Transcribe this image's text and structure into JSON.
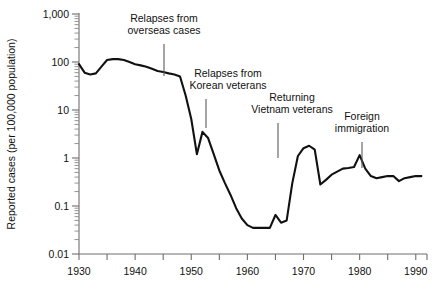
{
  "chart_data": {
    "type": "line",
    "title": "",
    "xlabel": "",
    "ylabel": "Reported cases (per 100,000 population)",
    "yscale": "log",
    "ylim": [
      0.01,
      1000
    ],
    "xlim": [
      1930,
      1992
    ],
    "grid": false,
    "legend": "none",
    "y_tick_labels": [
      "1,000",
      "100",
      "10",
      "1",
      "0.1",
      "0.01"
    ],
    "y_tick_values": [
      1000,
      100,
      10,
      1,
      0.1,
      0.01
    ],
    "x_tick_labels": [
      "1930",
      "1940",
      "1950",
      "1960",
      "1970",
      "1980",
      "1990"
    ],
    "x_tick_values": [
      1930,
      1940,
      1950,
      1960,
      1970,
      1980,
      1990
    ],
    "x_minor_tick_values": [
      1935,
      1945,
      1955,
      1965,
      1975,
      1985
    ],
    "series": [
      {
        "name": "Reported cases",
        "color": "#111111",
        "x": [
          1930,
          1931,
          1932,
          1933,
          1934,
          1935,
          1936,
          1937,
          1938,
          1939,
          1940,
          1941,
          1942,
          1943,
          1944,
          1945,
          1946,
          1947,
          1948,
          1949,
          1950,
          1951,
          1952,
          1953,
          1954,
          1955,
          1956,
          1957,
          1958,
          1959,
          1960,
          1961,
          1962,
          1963,
          1964,
          1965,
          1966,
          1967,
          1968,
          1969,
          1970,
          1971,
          1972,
          1973,
          1974,
          1975,
          1976,
          1977,
          1978,
          1979,
          1980,
          1981,
          1982,
          1983,
          1984,
          1985,
          1986,
          1987,
          1988,
          1989,
          1990,
          1991
        ],
        "y": [
          90,
          60,
          55,
          58,
          80,
          110,
          115,
          115,
          110,
          100,
          90,
          85,
          80,
          72,
          65,
          62,
          58,
          55,
          50,
          20,
          6.5,
          1.2,
          3.5,
          2.6,
          1.2,
          0.55,
          0.3,
          0.17,
          0.09,
          0.055,
          0.04,
          0.035,
          0.035,
          0.035,
          0.035,
          0.065,
          0.045,
          0.05,
          0.3,
          1.1,
          1.6,
          1.8,
          1.5,
          0.28,
          0.35,
          0.45,
          0.52,
          0.6,
          0.62,
          0.65,
          1.15,
          0.6,
          0.42,
          0.38,
          0.4,
          0.42,
          0.42,
          0.33,
          0.38,
          0.4,
          0.42,
          0.42
        ]
      }
    ],
    "annotations": [
      {
        "id": "overseas-cases",
        "lines": [
          "Relapses from",
          "overseas cases"
        ],
        "text_x": 164,
        "text_y": 22,
        "leader_x": 164,
        "leader_y1": 44,
        "leader_y2": 76
      },
      {
        "id": "korean-veterans",
        "lines": [
          "Relapses from",
          "Korean veterans"
        ],
        "text_x": 228,
        "text_y": 77,
        "leader_x": 206,
        "leader_y1": 99,
        "leader_y2": 128
      },
      {
        "id": "vietnam-veterans",
        "lines": [
          "Returning",
          "Vietnam veterans"
        ],
        "text_x": 292,
        "text_y": 101,
        "leader_x": 278,
        "leader_y1": 123,
        "leader_y2": 158
      },
      {
        "id": "foreign-immigration",
        "lines": [
          "Foreign",
          "immigration"
        ],
        "text_x": 362,
        "text_y": 120,
        "leader_x": 362,
        "leader_y1": 142,
        "leader_y2": 168
      }
    ]
  }
}
